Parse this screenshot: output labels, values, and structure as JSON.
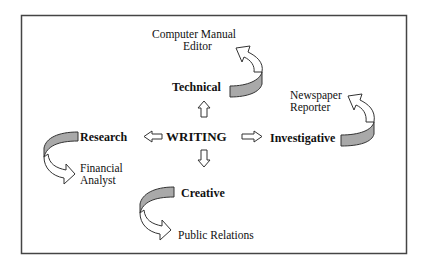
{
  "diagram": {
    "center": {
      "label": "WRITING"
    },
    "branches": [
      {
        "id": "technical",
        "label": "Technical",
        "direction": "up",
        "career": [
          "Computer Manual",
          "Editor"
        ]
      },
      {
        "id": "investigative",
        "label": "Investigative",
        "direction": "right",
        "career": [
          "Newspaper",
          "Reporter"
        ]
      },
      {
        "id": "research",
        "label": "Research",
        "direction": "left",
        "career": [
          "Financial",
          "Analyst"
        ]
      },
      {
        "id": "creative",
        "label": "Creative",
        "direction": "down",
        "career": [
          "Public Relations"
        ]
      }
    ],
    "colors": {
      "frame": "#444444",
      "arrow_fill": "#a9a9a9",
      "arrow_stroke": "#333333",
      "text": "#111111"
    }
  }
}
